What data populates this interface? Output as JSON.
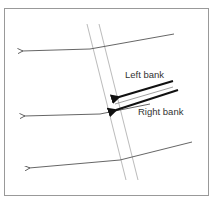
{
  "diagram": {
    "labels": {
      "left_bank": "Left bank",
      "right_bank": "Right bank"
    },
    "colors": {
      "frame": "#999999",
      "flow_line": "#555555",
      "channel": "#aaaaaa",
      "arrow": "#111111",
      "text": "#333333"
    }
  }
}
